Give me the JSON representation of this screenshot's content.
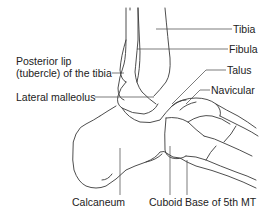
{
  "figure": {
    "type": "anatomical-diagram",
    "colors": {
      "line": "#3a3a3a",
      "text": "#222222",
      "background": "#ffffff"
    }
  },
  "labels": {
    "tibia": "Tibia",
    "fibula": "Fibula",
    "talus": "Talus",
    "navicular": "Navicular",
    "posterior_lip_line1": "Posterior lip",
    "posterior_lip_line2": "(tubercle) of the tibia",
    "lateral_malleolus": "Lateral malleolus",
    "calcaneum": "Calcaneum",
    "cuboid": "Cuboid",
    "base_5th_mt": "Base of 5th MT"
  }
}
